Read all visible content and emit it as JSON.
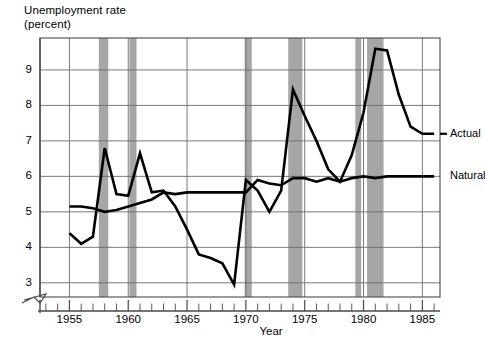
{
  "chart_data": {
    "type": "line",
    "title": "Unemployment rate\n(percent)",
    "xlabel": "Year",
    "ylabel": "Unemployment rate (percent)",
    "xlim": [
      1952.5,
      1986.5
    ],
    "ylim": [
      2.6,
      9.9
    ],
    "y_axis_break": true,
    "grid": true,
    "legend_position": "right-inline",
    "yticks": [
      3,
      4,
      5,
      6,
      7,
      8,
      9
    ],
    "ytick_labels": [
      "3",
      "4",
      "5",
      "6",
      "7",
      "8",
      "9"
    ],
    "xticks": [
      1955,
      1960,
      1965,
      1970,
      1975,
      1980,
      1985
    ],
    "xtick_labels": [
      "1955",
      "1960",
      "1965",
      "1970",
      "1975",
      "1980",
      "1985"
    ],
    "xtick_minor_step": 1,
    "series": [
      {
        "name": "Actual",
        "label": "Actual",
        "color": "#000000",
        "x": [
          1955,
          1956,
          1957,
          1958,
          1959,
          1960,
          1961,
          1962,
          1963,
          1964,
          1965,
          1966,
          1967,
          1968,
          1969,
          1970,
          1971,
          1972,
          1973,
          1974,
          1975,
          1976,
          1977,
          1978,
          1979,
          1980,
          1981,
          1982,
          1983,
          1984,
          1985,
          1986
        ],
        "values": [
          4.4,
          4.1,
          4.3,
          6.8,
          5.5,
          5.45,
          6.65,
          5.55,
          5.6,
          5.15,
          4.5,
          3.8,
          3.7,
          3.55,
          2.95,
          5.9,
          5.6,
          5.0,
          5.6,
          8.45,
          7.7,
          7.0,
          6.2,
          5.85,
          6.6,
          7.8,
          9.6,
          9.55,
          8.3,
          7.4,
          7.2,
          7.2
        ]
      },
      {
        "name": "Natural",
        "label": "Natural",
        "color": "#000000",
        "x": [
          1955,
          1956,
          1957,
          1958,
          1959,
          1960,
          1961,
          1962,
          1963,
          1964,
          1965,
          1966,
          1967,
          1968,
          1969,
          1970,
          1971,
          1972,
          1973,
          1974,
          1975,
          1976,
          1977,
          1978,
          1979,
          1980,
          1981,
          1982,
          1983,
          1984,
          1985,
          1986
        ],
        "values": [
          5.15,
          5.15,
          5.1,
          5.0,
          5.05,
          5.15,
          5.25,
          5.35,
          5.55,
          5.5,
          5.55,
          5.55,
          5.55,
          5.55,
          5.55,
          5.55,
          5.9,
          5.8,
          5.75,
          5.95,
          5.95,
          5.85,
          5.95,
          5.85,
          5.95,
          6.0,
          5.95,
          6.0,
          6.0,
          6.0,
          6.0,
          6.0
        ]
      }
    ],
    "recession_bands": [
      {
        "start": 1957.5,
        "end": 1958.3
      },
      {
        "start": 1960.1,
        "end": 1960.7
      },
      {
        "start": 1969.9,
        "end": 1970.5
      },
      {
        "start": 1973.6,
        "end": 1974.8
      },
      {
        "start": 1979.3,
        "end": 1979.8
      },
      {
        "start": 1980.3,
        "end": 1981.7
      }
    ],
    "recession_band_color": "#a6a6a6"
  },
  "labels": {
    "actual": "Actual",
    "natural": "Natural"
  }
}
